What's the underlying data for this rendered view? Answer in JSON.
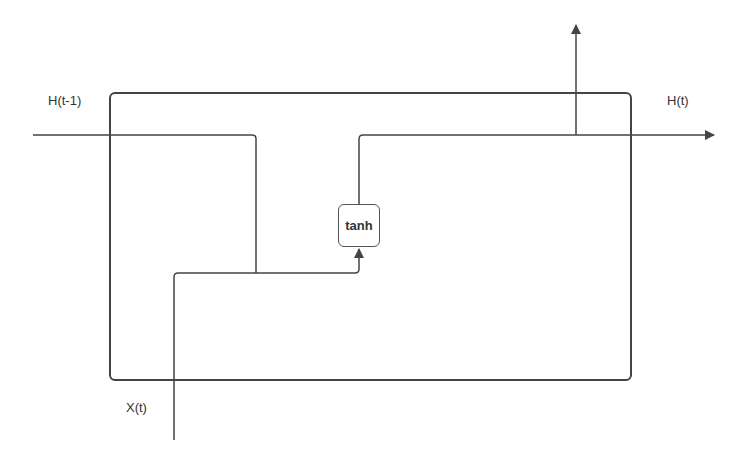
{
  "diagram": {
    "labels": {
      "prev_hidden": "H(t-1)",
      "hidden_out": "H(t)",
      "input": "X(t)",
      "activation": "tanh"
    },
    "colors": {
      "line": "#444444",
      "text": "#333333",
      "background": "#ffffff"
    }
  }
}
